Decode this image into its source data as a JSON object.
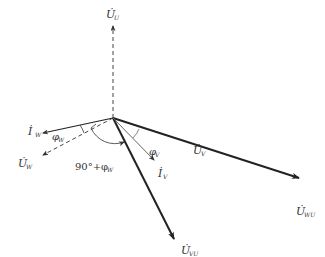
{
  "diagram": {
    "type": "phasor-diagram",
    "origin": {
      "x": 113,
      "y": 118
    },
    "phasors": [
      {
        "id": "U_U",
        "label": "U̇",
        "sub": "U",
        "style": "dashed",
        "weight": "thin",
        "tip": {
          "x": 113,
          "y": 25
        }
      },
      {
        "id": "U_V",
        "label": "U̇",
        "sub": "V",
        "style": "solid",
        "weight": "thick",
        "tip": {
          "x": 300,
          "y": 178
        }
      },
      {
        "id": "U_WU",
        "label": "U̇",
        "sub": "WU",
        "style": "solid",
        "weight": "thick",
        "tip": {
          "x": 300,
          "y": 178
        }
      },
      {
        "id": "U_VU",
        "label": "U̇",
        "sub": "VU",
        "style": "solid",
        "weight": "thick",
        "tip": {
          "x": 175,
          "y": 240
        }
      },
      {
        "id": "U_W",
        "label": "U̇",
        "sub": "W",
        "style": "dashed",
        "weight": "thin",
        "tip": {
          "x": 42,
          "y": 155
        }
      },
      {
        "id": "I_W",
        "label": "İ",
        "sub": "W",
        "style": "solid",
        "weight": "thin",
        "tip": {
          "x": 42,
          "y": 133
        }
      },
      {
        "id": "I_V",
        "label": "İ",
        "sub": "V",
        "style": "solid",
        "weight": "thin",
        "tip": {
          "x": 155,
          "y": 160
        }
      }
    ],
    "angles": [
      {
        "label": "φ",
        "sub": "W"
      },
      {
        "label": "φ",
        "sub": "V"
      },
      {
        "label": "90°+φ",
        "sub": "W"
      }
    ],
    "colors": {
      "line": "#222222",
      "text": "#333333",
      "background": "#ffffff"
    }
  }
}
